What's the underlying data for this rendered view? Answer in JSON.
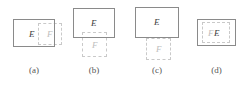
{
  "figure": {
    "type": "set-relation-diagram",
    "solid_border_color": "#8a8a8a",
    "dashed_border_color": "#c9c9c9",
    "label_e_color": "#3d3d3d",
    "label_f_color": "#bdbdbd",
    "caption_color": "#555555",
    "background_color": "#ffffff"
  },
  "panels": [
    {
      "id": "a",
      "caption": "(a)",
      "relation": "overlapping-horizontal",
      "shapes": [
        {
          "label": "E",
          "style": "solid",
          "x": 13,
          "y": 19,
          "width": 42,
          "height": 28
        },
        {
          "label": "F",
          "style": "dashed",
          "x": 38,
          "y": 23,
          "width": 24,
          "height": 22
        }
      ]
    },
    {
      "id": "b",
      "caption": "(b)",
      "relation": "overlapping-vertical",
      "shapes": [
        {
          "label": "E",
          "style": "solid",
          "x": 11,
          "y": 8,
          "width": 42,
          "height": 30
        },
        {
          "label": "F",
          "style": "dashed",
          "x": 20,
          "y": 32,
          "width": 25,
          "height": 25
        }
      ]
    },
    {
      "id": "c",
      "caption": "(c)",
      "relation": "adjacent-vertical",
      "shapes": [
        {
          "label": "E",
          "style": "solid",
          "x": 11,
          "y": 7,
          "width": 44,
          "height": 31
        },
        {
          "label": "F",
          "style": "dashed",
          "x": 22,
          "y": 38,
          "width": 25,
          "height": 22
        }
      ]
    },
    {
      "id": "d",
      "caption": "(d)",
      "relation": "nested-contained",
      "shapes": [
        {
          "label": "E",
          "style": "solid",
          "x": 11,
          "y": 19,
          "width": 39,
          "height": 27
        },
        {
          "label": "F",
          "style": "dashed",
          "x": 16,
          "y": 22,
          "width": 28,
          "height": 21
        }
      ]
    }
  ]
}
